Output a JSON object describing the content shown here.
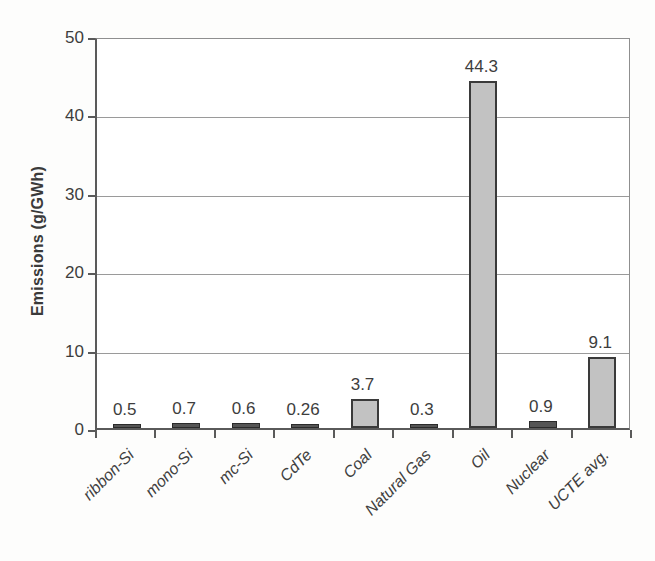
{
  "chart_data": {
    "type": "bar",
    "title": "",
    "xlabel": "",
    "ylabel": "Emissions (g/GWh)",
    "ylim": [
      0,
      50
    ],
    "yticks": [
      "0",
      "10",
      "20",
      "30",
      "40",
      "50"
    ],
    "ytick_values": [
      0,
      10,
      20,
      30,
      40,
      50
    ],
    "grid": "horizontal",
    "legend": "none",
    "bar_color": "#c2c2c2",
    "bar_edge_color": "#3a3a3a",
    "categories": [
      "ribbon-Si",
      "mono-Si",
      "mc-Si",
      "CdTe",
      "Coal",
      "Natural Gas",
      "Oil",
      "Nuclear",
      "UCTE avg."
    ],
    "values": [
      0.5,
      0.7,
      0.6,
      0.26,
      3.7,
      0.3,
      44.3,
      0.9,
      9.1
    ],
    "value_labels": [
      "0.5",
      "0.7",
      "0.6",
      "0.26",
      "3.7",
      "0.3",
      "44.3",
      "0.9",
      "9.1"
    ]
  }
}
